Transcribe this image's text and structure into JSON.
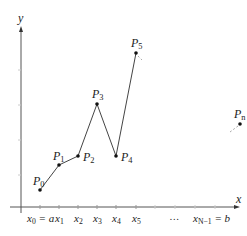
{
  "diagram": {
    "axes": {
      "x_label": "x",
      "y_label": "y"
    },
    "points": [
      {
        "name": "P",
        "sub": "0",
        "x": 40,
        "y": 190,
        "lx": 33,
        "ly": 185
      },
      {
        "name": "P",
        "sub": "1",
        "x": 59,
        "y": 165,
        "lx": 53,
        "ly": 160
      },
      {
        "name": "P",
        "sub": "2",
        "x": 78,
        "y": 156,
        "lx": 83,
        "ly": 161
      },
      {
        "name": "P",
        "sub": "3",
        "x": 97,
        "y": 104,
        "lx": 92,
        "ly": 98
      },
      {
        "name": "P",
        "sub": "4",
        "x": 116,
        "y": 156,
        "lx": 121,
        "ly": 161
      },
      {
        "name": "P",
        "sub": "5",
        "x": 136,
        "y": 53,
        "lx": 131,
        "ly": 47
      }
    ],
    "pn": {
      "name": "P",
      "sub": "n",
      "x": 240,
      "y": 124,
      "lx": 234,
      "ly": 118
    },
    "ticks": [
      {
        "x": 40,
        "label": "x",
        "sub": "0",
        "suffix": " = a"
      },
      {
        "x": 59,
        "label": "x",
        "sub": "1",
        "suffix": ""
      },
      {
        "x": 78,
        "label": "x",
        "sub": "2",
        "suffix": ""
      },
      {
        "x": 97,
        "label": "x",
        "sub": "3",
        "suffix": ""
      },
      {
        "x": 116,
        "label": "x",
        "sub": "4",
        "suffix": ""
      },
      {
        "x": 136,
        "label": "x",
        "sub": "5",
        "suffix": ""
      }
    ],
    "ellipsis": "…",
    "last_tick": {
      "label": "x",
      "sub": "N−1",
      "suffix": " = b"
    }
  }
}
